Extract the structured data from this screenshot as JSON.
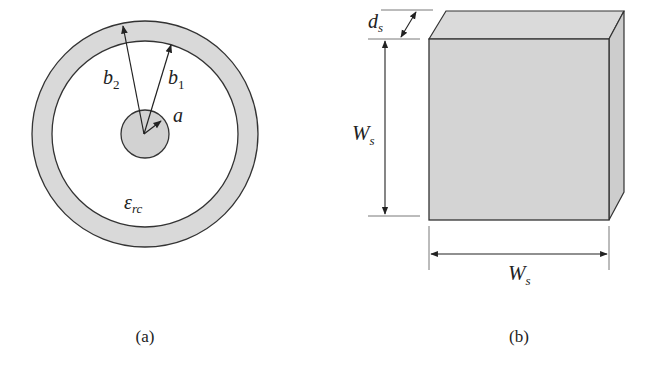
{
  "figure": {
    "panels": [
      {
        "id": "a",
        "caption": "(a)",
        "description": "Coaxial cross-section",
        "labels": {
          "outer_radius": {
            "base": "b",
            "sub": "2"
          },
          "inner_radius": {
            "base": "b",
            "sub": "1"
          },
          "core_radius": {
            "base": "a",
            "sub": ""
          },
          "permittivity": {
            "base": "ε",
            "sub": "rc"
          }
        }
      },
      {
        "id": "b",
        "caption": "(b)",
        "description": "Square slab with thickness",
        "labels": {
          "thickness": {
            "base": "d",
            "sub": "s"
          },
          "height": {
            "base": "W",
            "sub": "s"
          },
          "width": {
            "base": "W",
            "sub": "s"
          }
        }
      }
    ],
    "colors": {
      "stroke": "#333333",
      "fill_gray": "#d6d6d6",
      "fill_face": "#d4d4d4",
      "fill_top": "#dadada",
      "fill_side": "#cfcfcf",
      "background": "#ffffff"
    }
  }
}
